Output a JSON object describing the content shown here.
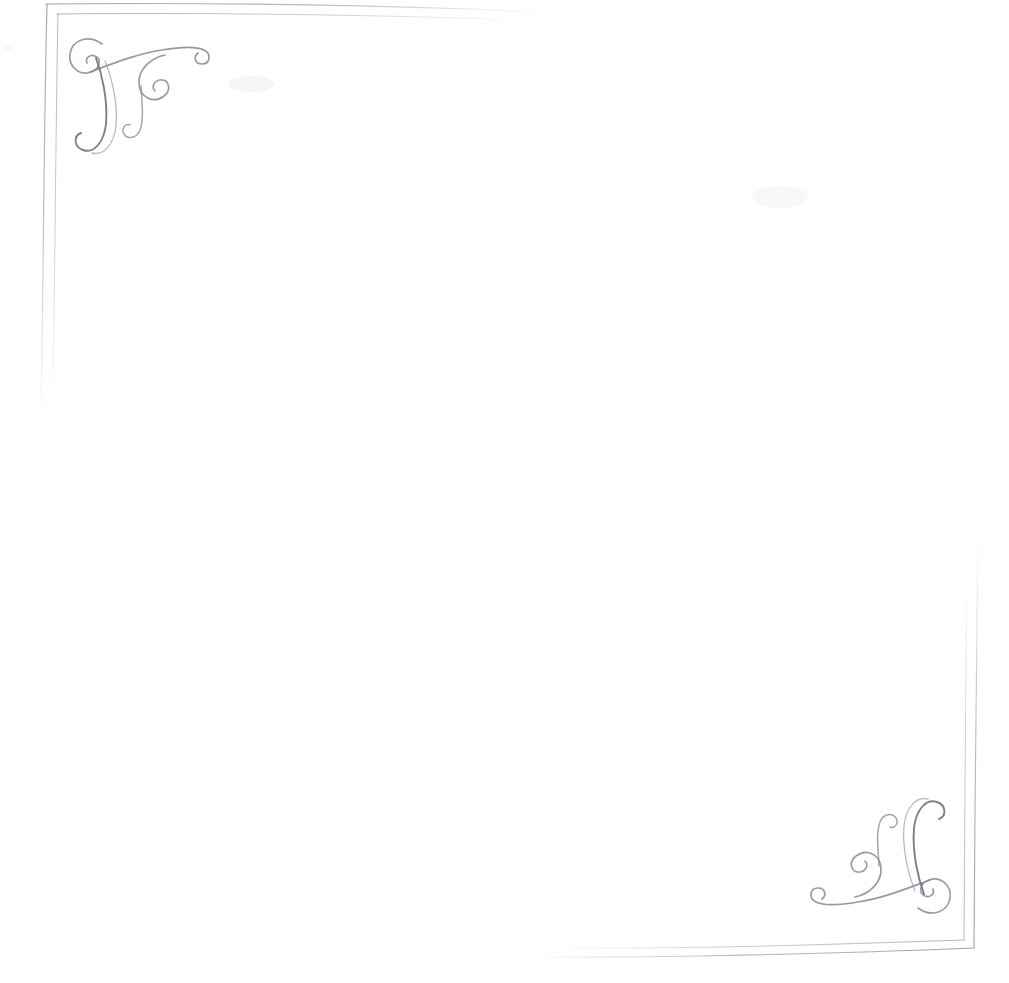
{
  "document": {
    "title": "Decorative Border Stationery Scan",
    "kind": "scanned-ornamental-frame",
    "background_color": "#ffffff",
    "width": 1009,
    "height": 983,
    "body_text": "",
    "caption": ""
  },
  "palette": {
    "paper": "#ffffff",
    "rule_ink": "#9aa0a8",
    "rule_ink_faint": "#c3c8ce",
    "flourish_ink": "#8a9099",
    "flourish_ink_dark": "#70767f",
    "smudge": "#fbfbfc"
  },
  "frame": {
    "name": "double-rule-frame",
    "stroke_style": "hand-drawn double rule, faded",
    "rules": [
      {
        "name": "top-outer-rule",
        "orientation": "horizontal",
        "path": "M 46 4 C 180 2.5 330 4.5 470 9 C 505 10 525 11.5 545 13",
        "stroke": "#9aa0a8",
        "width": 1.15,
        "opacity": 0.85,
        "fade": "right"
      },
      {
        "name": "top-inner-rule",
        "orientation": "horizontal",
        "path": "M 57 14 C 190 12.5 340 14.5 460 18 C 490 19 508 20 522 21",
        "stroke": "#9aa0a8",
        "width": 1.0,
        "opacity": 0.7,
        "fade": "right"
      },
      {
        "name": "left-outer-rule",
        "orientation": "vertical",
        "path": "M 47 4 C 45 80 44 180 43 270 C 42.3 330 41.8 380 41 418",
        "stroke": "#9aa0a8",
        "width": 1.15,
        "opacity": 0.85,
        "fade": "bottom"
      },
      {
        "name": "left-inner-rule",
        "orientation": "vertical",
        "path": "M 58 14 C 56.5 90 55.5 190 54.5 280 C 53.9 335 53.4 375 53 400",
        "stroke": "#9aa0a8",
        "width": 1.0,
        "opacity": 0.7,
        "fade": "bottom"
      },
      {
        "name": "right-outer-rule",
        "orientation": "vertical",
        "path": "M 978 536 C 977 620 976 720 975 810 C 974.4 870 974 920 974 948",
        "stroke": "#9aa0a8",
        "width": 1.15,
        "opacity": 0.85,
        "fade": "top"
      },
      {
        "name": "right-inner-rule",
        "orientation": "vertical",
        "path": "M 967 580 C 966 650 965.4 740 964.8 820 C 964.4 875 964.2 915 964 940",
        "stroke": "#9aa0a8",
        "width": 1.0,
        "opacity": 0.7,
        "fade": "top"
      },
      {
        "name": "bottom-outer-rule",
        "orientation": "horizontal",
        "path": "M 974 948 C 900 951 800 954 700 956 C 640 957 580 957.5 530 957",
        "stroke": "#9aa0a8",
        "width": 1.15,
        "opacity": 0.85,
        "fade": "left"
      },
      {
        "name": "bottom-inner-rule",
        "orientation": "horizontal",
        "path": "M 964 940 C 890 942.5 800 945.5 720 947 C 660 948 600 948.6 552 948",
        "stroke": "#9aa0a8",
        "width": 1.0,
        "opacity": 0.7,
        "fade": "left"
      }
    ]
  },
  "ornaments": [
    {
      "name": "corner-flourish-top-left",
      "position": "top-left",
      "rotation_degrees": 0,
      "origin_x": 62,
      "origin_y": 14,
      "ink": "#8a9099"
    },
    {
      "name": "corner-flourish-bottom-right",
      "position": "bottom-right",
      "rotation_degrees": 180,
      "origin_x": 958,
      "origin_y": 938,
      "ink": "#8a9099"
    }
  ],
  "artifacts": [
    {
      "name": "paper-smudge-upper-left",
      "x": 228,
      "y": 76,
      "width": 46,
      "height": 16,
      "opacity": 0.035
    },
    {
      "name": "paper-smudge-upper-right",
      "x": 752,
      "y": 186,
      "width": 56,
      "height": 22,
      "opacity": 0.03
    },
    {
      "name": "paper-speck-far-left",
      "x": 6,
      "y": 46,
      "width": 4,
      "height": 4,
      "opacity": 0.1
    }
  ]
}
